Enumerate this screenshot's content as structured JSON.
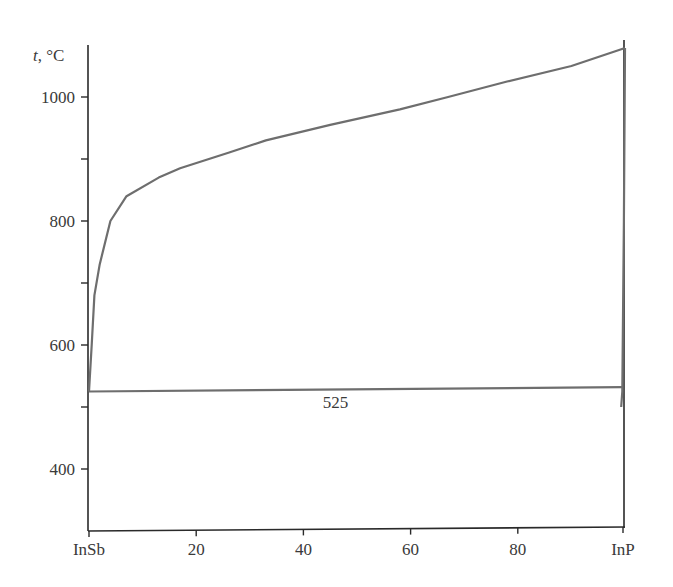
{
  "chart_data": {
    "type": "line",
    "title": "",
    "xlabel": "",
    "ylabel": "t, °C",
    "ylabel_italic_part": "t",
    "ylabel_unit_part": ", °C",
    "xlim": [
      0,
      100
    ],
    "ylim": [
      300,
      1100
    ],
    "x_ticks": [
      {
        "value": 0,
        "label": "InSb"
      },
      {
        "value": 20,
        "label": "20"
      },
      {
        "value": 40,
        "label": "40"
      },
      {
        "value": 60,
        "label": "60"
      },
      {
        "value": 80,
        "label": "80"
      },
      {
        "value": 100,
        "label": "InP"
      }
    ],
    "y_ticks": [
      {
        "value": 400,
        "label": "400"
      },
      {
        "value": 500,
        "label": ""
      },
      {
        "value": 600,
        "label": "600"
      },
      {
        "value": 700,
        "label": ""
      },
      {
        "value": 800,
        "label": "800"
      },
      {
        "value": 900,
        "label": ""
      },
      {
        "value": 1000,
        "label": "1000"
      }
    ],
    "grid": false,
    "legend": null,
    "series": [
      {
        "name": "liquidus",
        "x": [
          0,
          0.5,
          1,
          2,
          4,
          7,
          13,
          17,
          26,
          33,
          45,
          58,
          67,
          78,
          90,
          100
        ],
        "y": [
          525,
          600,
          680,
          730,
          800,
          840,
          870,
          885,
          910,
          930,
          955,
          980,
          1000,
          1025,
          1050,
          1079
        ]
      },
      {
        "name": "solidus (InP side)",
        "x": [
          99.3,
          99.5,
          99.8,
          100
        ],
        "y": [
          500,
          525,
          800,
          1079
        ]
      },
      {
        "name": "eutectic",
        "x": [
          0,
          99.5
        ],
        "y": [
          525,
          532
        ]
      }
    ],
    "annotations": [
      {
        "text": "525",
        "x": 46,
        "y": 500
      }
    ]
  }
}
